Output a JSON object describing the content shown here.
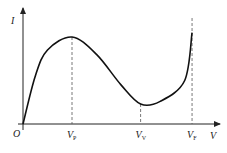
{
  "diagram": {
    "axes": {
      "x_label": "V",
      "y_label": "I",
      "origin_label": "O"
    },
    "markers": [
      {
        "id": "peak",
        "label_main": "V",
        "label_sub": "P"
      },
      {
        "id": "valley",
        "label_main": "V",
        "label_sub": "V"
      },
      {
        "id": "forward",
        "label_main": "V",
        "label_sub": "F"
      }
    ],
    "curve": {
      "description": "Current rises from origin to a peak at V_P, falls to a valley at V_V (negative resistance region), then rises sharply near V_F",
      "points": [
        {
          "v": 0.0,
          "i": 0.0
        },
        {
          "v": 0.25,
          "i": 0.55
        },
        {
          "v": 0.5,
          "i": 0.85
        },
        {
          "v": 1.0,
          "i": 1.0
        },
        {
          "v": 1.5,
          "i": 0.8
        },
        {
          "v": 2.0,
          "i": 0.45
        },
        {
          "v": 2.4,
          "i": 0.23
        },
        {
          "v": 2.8,
          "i": 0.26
        },
        {
          "v": 3.3,
          "i": 0.5
        },
        {
          "v": 3.45,
          "i": 1.05
        }
      ],
      "v_peak": 1.0,
      "v_valley": 2.4,
      "v_forward": 3.45
    }
  }
}
